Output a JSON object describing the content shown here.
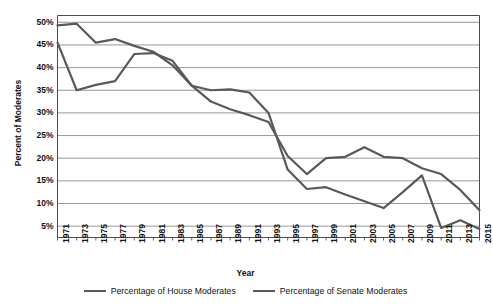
{
  "chart_data": {
    "type": "line",
    "title": "",
    "xlabel": "Year",
    "ylabel": "Percent of Moderates",
    "x": [
      1971,
      1973,
      1975,
      1977,
      1979,
      1981,
      1983,
      1985,
      1987,
      1989,
      1991,
      1993,
      1995,
      1997,
      1999,
      2001,
      2003,
      2005,
      2007,
      2009,
      2011,
      2013,
      2015
    ],
    "categories": [
      "1971",
      "1973",
      "1975",
      "1977",
      "1979",
      "1981",
      "1983",
      "1985",
      "1987",
      "1989",
      "1991",
      "1993",
      "1995",
      "1997",
      "1999",
      "2001",
      "2003",
      "2005",
      "2007",
      "2009",
      "2011",
      "2013",
      "2015"
    ],
    "ylim": [
      2.5,
      51.5
    ],
    "yticks": [
      5,
      10,
      15,
      20,
      25,
      30,
      35,
      40,
      45,
      50
    ],
    "ytick_labels": [
      "5%",
      "10%",
      "15%",
      "20%",
      "25%",
      "30%",
      "35%",
      "40%",
      "45%",
      "50%"
    ],
    "grid": true,
    "legend_position": "bottom",
    "series": [
      {
        "name": "Percentage of House Moderates",
        "color": "#595959",
        "values": [
          45.5,
          35.0,
          36.2,
          37.0,
          43.0,
          43.2,
          41.5,
          36.0,
          35.0,
          35.2,
          34.5,
          30.0,
          17.5,
          13.2,
          13.6,
          12.0,
          10.5,
          9.0,
          12.5,
          16.2,
          4.6,
          6.3,
          4.4
        ]
      },
      {
        "name": "Percentage of Senate Moderates",
        "color": "#595959",
        "values": [
          49.3,
          49.7,
          45.5,
          46.3,
          44.8,
          43.5,
          40.5,
          36.0,
          32.5,
          30.8,
          29.5,
          28.0,
          20.5,
          16.5,
          20.0,
          20.3,
          22.4,
          20.3,
          20.0,
          17.8,
          16.5,
          13.0,
          8.5
        ]
      }
    ]
  },
  "axes": {
    "ylabel": "Percent of Moderates",
    "xlabel": "Year"
  },
  "legend": {
    "items": [
      {
        "label": "Percentage of House Moderates"
      },
      {
        "label": "Percentage of Senate Moderates"
      }
    ]
  }
}
